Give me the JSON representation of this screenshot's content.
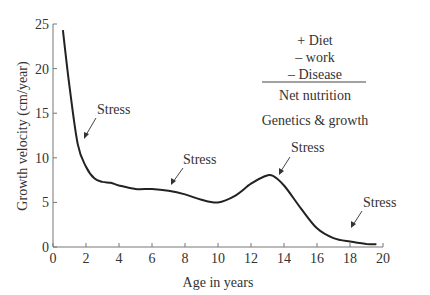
{
  "chart_data": {
    "type": "line",
    "title": "",
    "xlabel": "Age in years",
    "ylabel": "Growth velocity (cm/year)",
    "xlim": [
      0,
      20
    ],
    "ylim": [
      0,
      25
    ],
    "xticks": [
      0,
      2,
      4,
      6,
      8,
      10,
      12,
      14,
      16,
      18,
      20
    ],
    "yticks": [
      0,
      5,
      10,
      15,
      20,
      25
    ],
    "grid": false,
    "legend": null,
    "series": [
      {
        "name": "Growth velocity",
        "x": [
          0.6,
          1.0,
          1.5,
          2.0,
          2.5,
          3.0,
          3.5,
          4.0,
          5.0,
          6.0,
          7.0,
          8.0,
          9.0,
          10.0,
          11.0,
          12.0,
          12.8,
          13.3,
          14.0,
          15.0,
          16.0,
          17.0,
          18.0,
          19.0,
          19.6
        ],
        "values": [
          24.3,
          18.0,
          11.5,
          9.0,
          7.7,
          7.3,
          7.2,
          6.9,
          6.5,
          6.5,
          6.3,
          5.9,
          5.3,
          5.0,
          5.7,
          7.1,
          7.9,
          8.0,
          6.9,
          4.4,
          2.1,
          1.0,
          0.6,
          0.35,
          0.3
        ]
      }
    ],
    "annotations": [
      {
        "text": "Stress",
        "x": 1.6,
        "y": 12.0
      },
      {
        "text": "Stress",
        "x": 6.8,
        "y": 6.4
      },
      {
        "text": "Stress",
        "x": 12.8,
        "y": 7.9
      },
      {
        "text": "Stress",
        "x": 16.9,
        "y": 2.0
      }
    ],
    "inset_text": {
      "lines": [
        "+ Diet",
        "– work",
        "– Disease"
      ],
      "result": "Net nutrition",
      "footer": "Genetics & growth"
    }
  },
  "labels": {
    "stress": "Stress",
    "diet": "+ Diet",
    "work": "– work",
    "disease": "– Disease",
    "net": "Net nutrition",
    "genetics": "Genetics & growth"
  }
}
